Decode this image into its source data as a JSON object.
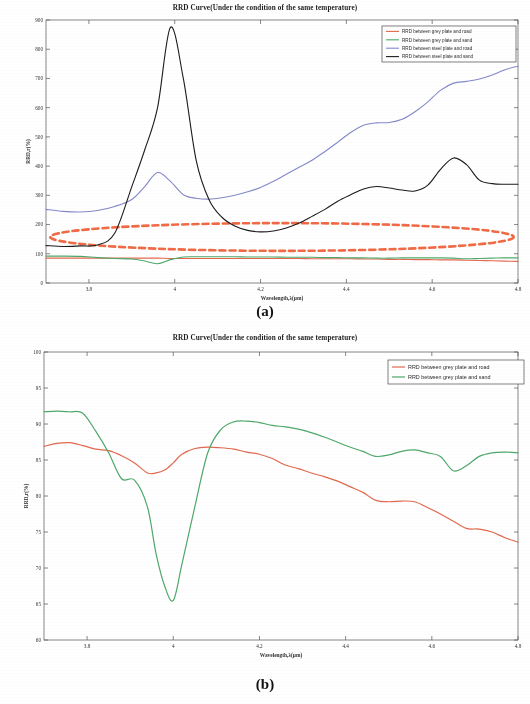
{
  "figure_a": {
    "label": "(a)",
    "title": "RRD Curve(Under the condition of the same temperature)",
    "xlabel": "Wavelength,λ(μm)",
    "ylabel": "RRD,r(%)",
    "annotation_name": "red-dashed-ellipse"
  },
  "figure_b": {
    "label": "(b)",
    "title": "RRD Curve(Under the condition of the same temperature)",
    "xlabel": "Wavelength,λ(μm)",
    "ylabel": "RRD,r(%)"
  },
  "colors": {
    "series_red": "#e2694f",
    "series_green": "#4fa86b",
    "series_blue": "#8389c9",
    "series_black": "#1c1c1c",
    "annotation_red": "#ef6a45",
    "axis": "#555555",
    "grid": "#cfcfcf"
  },
  "chart_data": [
    {
      "type": "line",
      "id": "a",
      "title": "RRD Curve(Under the condition of the same temperature)",
      "xlabel": "Wavelength,λ(μm)",
      "ylabel": "RRD,r(%)",
      "xlim": [
        3.7,
        4.8
      ],
      "ylim": [
        0,
        900
      ],
      "xticks": [
        3.8,
        4,
        4.2,
        4.4,
        4.6,
        4.8
      ],
      "xticklabels": [
        "3.8",
        "4",
        "4.2",
        "4.4",
        "4.6",
        "4.8"
      ],
      "yticks": [
        0,
        100,
        200,
        300,
        400,
        500,
        600,
        700,
        800,
        900
      ],
      "yticklabels": [
        "0",
        "100",
        "200",
        "300",
        "400",
        "500",
        "600",
        "700",
        "800",
        "900"
      ],
      "grid": false,
      "legend_position": "top-right",
      "annotations": [
        {
          "type": "ellipse-dashed",
          "color": "#ef6a45",
          "x_range": [
            3.71,
            4.79
          ],
          "y_range": [
            110,
            205
          ]
        }
      ],
      "x": [
        3.7,
        3.74,
        3.78,
        3.82,
        3.86,
        3.9,
        3.93,
        3.96,
        3.99,
        4.02,
        4.05,
        4.08,
        4.11,
        4.14,
        4.17,
        4.2,
        4.23,
        4.26,
        4.29,
        4.32,
        4.35,
        4.38,
        4.41,
        4.44,
        4.47,
        4.5,
        4.53,
        4.56,
        4.59,
        4.62,
        4.65,
        4.68,
        4.71,
        4.74,
        4.77,
        4.8
      ],
      "series": [
        {
          "name": "RRD between grey plate and road",
          "color": "#e2694f",
          "values": [
            85,
            85,
            85,
            85,
            85,
            85,
            85,
            85,
            84,
            84,
            84,
            84,
            84,
            84,
            84,
            84,
            84,
            84,
            84,
            83,
            83,
            83,
            83,
            82,
            82,
            81,
            81,
            80,
            80,
            79,
            79,
            78,
            77,
            76,
            75,
            74
          ]
        },
        {
          "name": "RRD between grey plate and sand",
          "color": "#4fa86b",
          "values": [
            92,
            92,
            91,
            87,
            84,
            82,
            75,
            66,
            80,
            89,
            90,
            90,
            90,
            90,
            89,
            89,
            89,
            88,
            88,
            88,
            87,
            87,
            86,
            86,
            85,
            85,
            86,
            86,
            86,
            86,
            85,
            83,
            84,
            85,
            86,
            86
          ]
        },
        {
          "name": "RRD between steel plate and road",
          "color": "#8389c9",
          "values": [
            252,
            245,
            243,
            248,
            262,
            286,
            330,
            378,
            348,
            302,
            290,
            287,
            292,
            300,
            312,
            327,
            348,
            372,
            396,
            420,
            450,
            482,
            515,
            540,
            548,
            549,
            560,
            586,
            620,
            660,
            684,
            690,
            698,
            712,
            730,
            742
          ]
        },
        {
          "name": "RRD between steel plate and sand",
          "color": "#1c1c1c",
          "values": [
            128,
            125,
            127,
            130,
            170,
            330,
            455,
            600,
            875,
            700,
            420,
            285,
            225,
            195,
            180,
            175,
            178,
            188,
            205,
            228,
            252,
            280,
            302,
            322,
            330,
            325,
            318,
            315,
            335,
            390,
            428,
            405,
            352,
            340,
            338,
            338
          ]
        }
      ]
    },
    {
      "type": "line",
      "id": "b",
      "title": "RRD Curve(Under the condition of the same temperature)",
      "xlabel": "Wavelength,λ(μm)",
      "ylabel": "RRD,r(%)",
      "xlim": [
        3.7,
        4.8
      ],
      "ylim": [
        60,
        100
      ],
      "xticks": [
        3.8,
        4,
        4.2,
        4.4,
        4.6,
        4.8
      ],
      "xticklabels": [
        "3.8",
        "4",
        "4.2",
        "4.4",
        "4.6",
        "4.8"
      ],
      "yticks": [
        60,
        65,
        70,
        75,
        80,
        85,
        90,
        95,
        100
      ],
      "yticklabels": [
        "60",
        "65",
        "70",
        "75",
        "80",
        "85",
        "90",
        "95",
        "100"
      ],
      "grid": false,
      "legend_position": "top-right",
      "x": [
        3.7,
        3.73,
        3.76,
        3.79,
        3.82,
        3.85,
        3.88,
        3.91,
        3.94,
        3.96,
        3.98,
        4.0,
        4.02,
        4.05,
        4.08,
        4.11,
        4.14,
        4.17,
        4.2,
        4.23,
        4.26,
        4.29,
        4.32,
        4.35,
        4.38,
        4.41,
        4.44,
        4.47,
        4.5,
        4.53,
        4.56,
        4.59,
        4.62,
        4.65,
        4.68,
        4.71,
        4.74,
        4.77,
        4.8
      ],
      "series": [
        {
          "name": "RRD between grey plate and road",
          "color": "#e2694f",
          "values": [
            86.9,
            87.3,
            87.4,
            87.0,
            86.5,
            86.3,
            85.6,
            84.6,
            83.2,
            83.2,
            83.6,
            84.6,
            85.8,
            86.6,
            86.8,
            86.7,
            86.5,
            86.1,
            85.8,
            85.2,
            84.3,
            83.8,
            83.2,
            82.7,
            82.1,
            81.3,
            80.5,
            79.4,
            79.2,
            79.3,
            79.2,
            78.4,
            77.5,
            76.5,
            75.5,
            75.4,
            75.0,
            74.2,
            73.6
          ]
        },
        {
          "name": "RRD between grey plate and sand",
          "color": "#4fa86b",
          "values": [
            91.7,
            91.8,
            91.7,
            91.5,
            89.0,
            86.0,
            82.4,
            82.2,
            78.5,
            72.0,
            67.5,
            65.5,
            70.5,
            78.5,
            86.0,
            89.2,
            90.3,
            90.4,
            90.2,
            89.8,
            89.6,
            89.3,
            88.8,
            88.2,
            87.5,
            86.8,
            86.2,
            85.5,
            85.7,
            86.2,
            86.4,
            86.0,
            85.5,
            83.5,
            84.2,
            85.5,
            86.0,
            86.1,
            86.0
          ]
        }
      ]
    }
  ]
}
